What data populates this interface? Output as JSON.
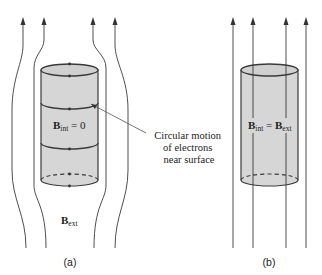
{
  "panels": {
    "a": {
      "caption": "(a)",
      "interior_label_main": "B",
      "interior_label_sub": "int",
      "interior_label_rest": " = 0",
      "exterior_label_main": "B",
      "exterior_label_sub": "ext",
      "annotation": [
        "Circular motion",
        "of electrons",
        "near surface"
      ]
    },
    "b": {
      "caption": "(b)",
      "interior_label_main": "B",
      "interior_label_sub": "int",
      "interior_label_eq": " = ",
      "interior_label_main2": "B",
      "interior_label_sub2": "ext"
    }
  },
  "colors": {
    "line": "#3a3a3a",
    "cylinder_fill": "#d6d6d6",
    "background": "#ffffff"
  }
}
